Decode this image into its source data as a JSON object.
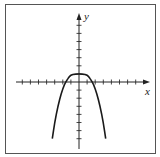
{
  "chart_data": {
    "type": "line",
    "title": "",
    "xlabel": "x",
    "ylabel": "y",
    "xlim": [
      -8,
      8
    ],
    "ylim": [
      -8,
      8
    ],
    "grid": false,
    "legend": null,
    "tick_spacing_units": 1,
    "x_ticks": [
      -7,
      -6,
      -5,
      -4,
      -3,
      -2,
      -1,
      1,
      2,
      3,
      4,
      5,
      6,
      7
    ],
    "y_ticks": [
      -7,
      -6,
      -5,
      -4,
      -3,
      -2,
      -1,
      1,
      2,
      3,
      4,
      5,
      6,
      7
    ],
    "tick_labels_shown": false,
    "series": [
      {
        "name": "f(x)",
        "description": "flat-topped inverted even-degree curve, max at (0,1), x-intercepts near ±1.5, both ends falling downward",
        "points": [
          [
            -3.3,
            -7.0
          ],
          [
            -3.0,
            -5.0
          ],
          [
            -2.6,
            -3.0
          ],
          [
            -2.2,
            -1.4
          ],
          [
            -1.8,
            -0.3
          ],
          [
            -1.5,
            0.2
          ],
          [
            -1.2,
            0.7
          ],
          [
            -0.8,
            0.95
          ],
          [
            0.0,
            1.0
          ],
          [
            0.8,
            0.95
          ],
          [
            1.2,
            0.7
          ],
          [
            1.5,
            0.2
          ],
          [
            1.8,
            -0.3
          ],
          [
            2.2,
            -1.4
          ],
          [
            2.6,
            -3.0
          ],
          [
            3.0,
            -5.0
          ],
          [
            3.3,
            -7.0
          ]
        ]
      }
    ]
  },
  "labels": {
    "x_axis": "x",
    "y_axis": "y"
  },
  "colors": {
    "axis": "#222222",
    "curve": "#1a1a1a",
    "frame": "#555555"
  }
}
